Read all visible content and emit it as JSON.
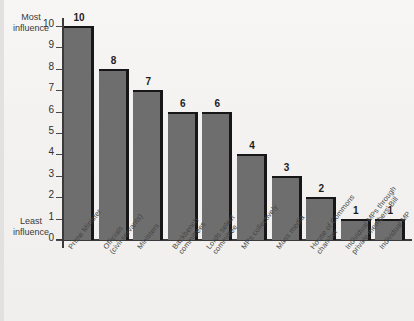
{
  "chart_data": {
    "type": "bar",
    "title": "",
    "xlabel": "",
    "ylabel": "",
    "ylim": [
      0,
      10
    ],
    "grid": false,
    "legend": "none",
    "y_ticks": [
      "0",
      "1",
      "2",
      "3",
      "4",
      "5",
      "6",
      "7",
      "8",
      "9",
      "10"
    ],
    "axis_notes": {
      "top": "Most\ninfluence",
      "top_line1": "Most",
      "top_line2": "influence",
      "bottom": "Least\ninfluence",
      "bottom_line1": "Least",
      "bottom_line2": "influence"
    },
    "categories": [
      "Prime Minister",
      "Officials\n(civil servants)",
      "Ministers",
      "Backbench\ncommittees",
      "Lords select\ncommittee",
      "MPs collectively",
      "Mass media",
      "House of Commons\nchamber",
      "Individual MPs through\nprivate members' Bill",
      "Individual MP"
    ],
    "values": [
      10,
      8,
      7,
      6,
      6,
      4,
      3,
      2,
      1,
      1
    ],
    "value_labels": [
      "10",
      "8",
      "7",
      "6",
      "6",
      "4",
      "3",
      "2",
      "1",
      "1"
    ],
    "colors": {
      "bar_fill": "#6e6e6e",
      "bar_edge": "#17171a",
      "axis": "#3a3a3a",
      "background": "#f4f3f1",
      "text": "#2f2f2f"
    }
  }
}
